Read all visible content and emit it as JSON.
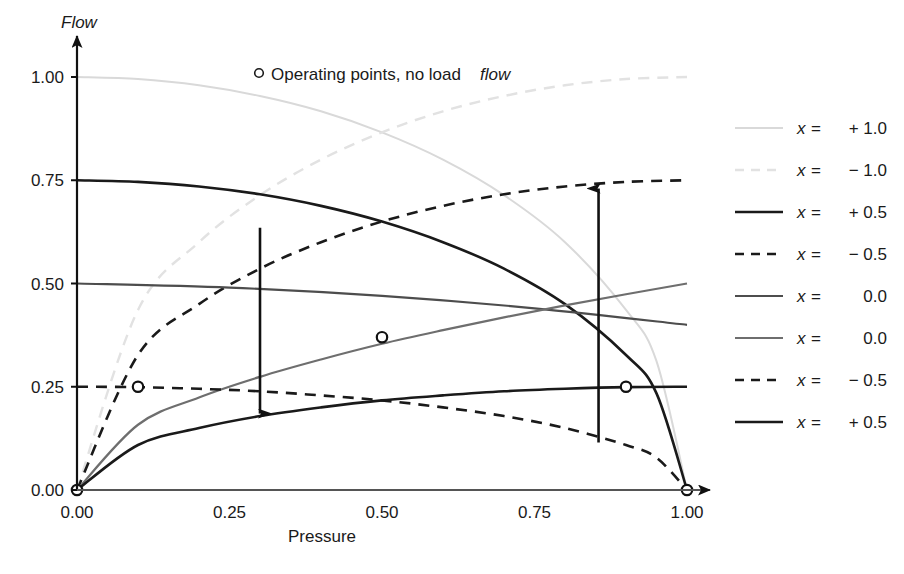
{
  "chart_data": {
    "type": "line",
    "title": "",
    "xlabel": "Pressure",
    "ylabel": "Flow",
    "xlim": [
      0.0,
      1.0
    ],
    "ylim": [
      0.0,
      1.0
    ],
    "xticks": [
      "0.00",
      "0.25",
      "0.50",
      "0.75",
      "1.00"
    ],
    "xtick_values": [
      0.0,
      0.25,
      0.5,
      0.75,
      1.0
    ],
    "yticks": [
      "0.00",
      "0.25",
      "0.50",
      "0.75",
      "1.00"
    ],
    "ytick_values": [
      0.0,
      0.25,
      0.5,
      0.75,
      1.0
    ],
    "grid": false,
    "legend_position": "right-outside",
    "annotation": {
      "marker": "open-circle",
      "text_plain": "Operating points, no load ",
      "text_italic": "flow"
    },
    "series": [
      {
        "name": "x = + 1.0",
        "label_var": "x",
        "label_eq": "=",
        "label_val": "+ 1.0",
        "style": "solid",
        "color": "#d9d9d9",
        "width": 2.0,
        "kind": "source-falling",
        "points": [
          [
            0.0,
            1.0
          ],
          [
            0.1,
            0.995
          ],
          [
            0.2,
            0.98
          ],
          [
            0.3,
            0.954
          ],
          [
            0.4,
            0.917
          ],
          [
            0.5,
            0.866
          ],
          [
            0.6,
            0.8
          ],
          [
            0.7,
            0.714
          ],
          [
            0.8,
            0.6
          ],
          [
            0.9,
            0.436
          ],
          [
            0.95,
            0.312
          ],
          [
            1.0,
            0.0
          ]
        ]
      },
      {
        "name": "x = - 1.0",
        "label_var": "x",
        "label_eq": "=",
        "label_val": "− 1.0",
        "style": "dashed",
        "color": "#e2e2e2",
        "width": 2.4,
        "kind": "load-rising",
        "points": [
          [
            0.0,
            0.0
          ],
          [
            0.1,
            0.436
          ],
          [
            0.2,
            0.6
          ],
          [
            0.3,
            0.714
          ],
          [
            0.4,
            0.8
          ],
          [
            0.5,
            0.866
          ],
          [
            0.6,
            0.917
          ],
          [
            0.7,
            0.954
          ],
          [
            0.8,
            0.98
          ],
          [
            0.9,
            0.995
          ],
          [
            1.0,
            1.0
          ]
        ]
      },
      {
        "name": "x = + 0.5 (upper source)",
        "label_var": "x",
        "label_eq": "=",
        "label_val": "+ 0.5",
        "style": "solid",
        "color": "#1a1a1a",
        "width": 2.6,
        "kind": "source-falling",
        "points": [
          [
            0.0,
            0.75
          ],
          [
            0.1,
            0.746
          ],
          [
            0.2,
            0.735
          ],
          [
            0.3,
            0.716
          ],
          [
            0.4,
            0.688
          ],
          [
            0.5,
            0.65
          ],
          [
            0.6,
            0.6
          ],
          [
            0.7,
            0.536
          ],
          [
            0.8,
            0.45
          ],
          [
            0.9,
            0.327
          ],
          [
            0.95,
            0.234
          ],
          [
            1.0,
            0.0
          ]
        ]
      },
      {
        "name": "x = - 0.5 (upper load)",
        "label_var": "x",
        "label_eq": "=",
        "label_val": "− 0.5",
        "style": "dashed",
        "color": "#1a1a1a",
        "width": 2.6,
        "kind": "load-rising",
        "points": [
          [
            0.0,
            0.0
          ],
          [
            0.1,
            0.327
          ],
          [
            0.2,
            0.45
          ],
          [
            0.3,
            0.536
          ],
          [
            0.4,
            0.6
          ],
          [
            0.5,
            0.65
          ],
          [
            0.6,
            0.688
          ],
          [
            0.7,
            0.716
          ],
          [
            0.8,
            0.735
          ],
          [
            0.9,
            0.746
          ],
          [
            1.0,
            0.75
          ]
        ]
      },
      {
        "name": "x = 0.0 (falling)",
        "label_var": "x",
        "label_eq": "=",
        "label_val": "0.0",
        "style": "solid",
        "color": "#4d4d4d",
        "width": 2.2,
        "kind": "source-falling",
        "points": [
          [
            0.0,
            0.5
          ],
          [
            0.25,
            0.49
          ],
          [
            0.5,
            0.47
          ],
          [
            0.75,
            0.44
          ],
          [
            1.0,
            0.4
          ]
        ]
      },
      {
        "name": "x = 0.0 (rising)",
        "label_var": "x",
        "label_eq": "=",
        "label_val": "0.0",
        "style": "solid",
        "color": "#6e6e6e",
        "width": 2.2,
        "kind": "load-rising",
        "points": [
          [
            0.0,
            0.0
          ],
          [
            0.1,
            0.158
          ],
          [
            0.2,
            0.224
          ],
          [
            0.3,
            0.274
          ],
          [
            0.4,
            0.316
          ],
          [
            0.5,
            0.354
          ],
          [
            0.6,
            0.387
          ],
          [
            0.7,
            0.418
          ],
          [
            0.8,
            0.447
          ],
          [
            0.9,
            0.474
          ],
          [
            1.0,
            0.5
          ]
        ]
      },
      {
        "name": "x = - 0.5 (lower load)",
        "label_var": "x",
        "label_eq": "=",
        "label_val": "− 0.5",
        "style": "dashed",
        "color": "#1a1a1a",
        "width": 2.6,
        "kind": "source-falling",
        "points": [
          [
            0.0,
            0.25
          ],
          [
            0.1,
            0.249
          ],
          [
            0.2,
            0.245
          ],
          [
            0.3,
            0.239
          ],
          [
            0.4,
            0.229
          ],
          [
            0.5,
            0.217
          ],
          [
            0.6,
            0.2
          ],
          [
            0.7,
            0.179
          ],
          [
            0.8,
            0.15
          ],
          [
            0.9,
            0.109
          ],
          [
            0.95,
            0.078
          ],
          [
            1.0,
            0.0
          ]
        ]
      },
      {
        "name": "x = + 0.5 (lower source)",
        "label_var": "x",
        "label_eq": "=",
        "label_val": "+ 0.5",
        "style": "solid",
        "color": "#1a1a1a",
        "width": 2.6,
        "kind": "load-rising",
        "points": [
          [
            0.0,
            0.0
          ],
          [
            0.1,
            0.109
          ],
          [
            0.2,
            0.15
          ],
          [
            0.3,
            0.179
          ],
          [
            0.4,
            0.2
          ],
          [
            0.5,
            0.217
          ],
          [
            0.6,
            0.229
          ],
          [
            0.7,
            0.239
          ],
          [
            0.8,
            0.245
          ],
          [
            0.9,
            0.249
          ],
          [
            1.0,
            0.25
          ]
        ]
      }
    ],
    "operating_points": [
      {
        "x": 0.0,
        "y": 0.0
      },
      {
        "x": 0.1,
        "y": 0.25
      },
      {
        "x": 0.5,
        "y": 0.37
      },
      {
        "x": 0.9,
        "y": 0.25
      },
      {
        "x": 1.0,
        "y": 0.0
      }
    ],
    "arrows": [
      {
        "name": "down-arrow",
        "x": 0.3,
        "y_from": 0.635,
        "y_to": 0.185,
        "direction": "down"
      },
      {
        "name": "up-arrow",
        "x": 0.855,
        "y_from": 0.115,
        "y_to": 0.73,
        "direction": "up"
      }
    ]
  }
}
